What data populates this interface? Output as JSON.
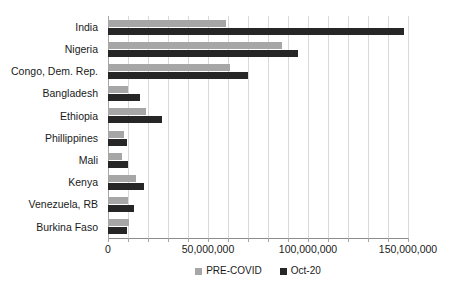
{
  "chart_data": {
    "type": "bar",
    "orientation": "horizontal",
    "title": "",
    "xlabel": "",
    "ylabel": "",
    "categories": [
      "India",
      "Nigeria",
      "Congo, Dem. Rep.",
      "Bangladesh",
      "Ethiopia",
      "Phillippines",
      "Mali",
      "Kenya",
      "Venezuela, RB",
      "Burkina Faso"
    ],
    "series": [
      {
        "name": "PRE-COVID",
        "color": "#a6a6a6",
        "values": [
          59000000,
          87000000,
          61000000,
          10000000,
          19000000,
          8000000,
          7000000,
          14000000,
          10000000,
          10500000
        ]
      },
      {
        "name": "Oct-20",
        "color": "#262626",
        "values": [
          148000000,
          95000000,
          70000000,
          16000000,
          27000000,
          9500000,
          10000000,
          18000000,
          13000000,
          9500000
        ]
      }
    ],
    "xlim": [
      0,
      150000000
    ],
    "xticks": [
      0,
      50000000,
      100000000,
      150000000
    ],
    "xtick_labels": [
      "0",
      "50,000,000",
      "100,000,000",
      "150,000,000"
    ],
    "gridline_interval": 10000000,
    "grid": true,
    "legend_position": "bottom",
    "legend": [
      {
        "label": "PRE-COVID",
        "color": "#a6a6a6"
      },
      {
        "label": "Oct-20",
        "color": "#262626"
      }
    ]
  }
}
